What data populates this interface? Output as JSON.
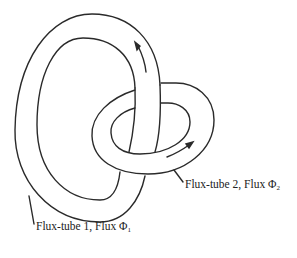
{
  "diagram": {
    "colors": {
      "stroke": "#2a2a2a",
      "background": "#ffffff",
      "text": "#222222"
    },
    "labels": {
      "tube1": {
        "text": "Flux-tube 1, Flux ",
        "symbol": "Φ",
        "subscript": "1"
      },
      "tube2": {
        "text": "Flux-tube 2, Flux ",
        "symbol": "Φ",
        "subscript": "2"
      }
    },
    "arrows": [
      {
        "on": "tube1",
        "direction": "up-left"
      },
      {
        "on": "tube2",
        "direction": "up-right"
      }
    ]
  }
}
